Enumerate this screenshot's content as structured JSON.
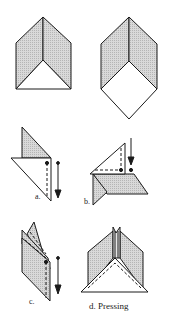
{
  "diagram": {
    "colors": {
      "stroke": "#1a1a1a",
      "shade": "#cfcfcf",
      "paper": "#ffffff"
    },
    "figures": [
      {
        "id": "top-left",
        "label": ""
      },
      {
        "id": "top-right",
        "label": ""
      },
      {
        "id": "a",
        "label": "a."
      },
      {
        "id": "b",
        "label": "b."
      },
      {
        "id": "c",
        "label": "c."
      },
      {
        "id": "d",
        "label": "d.  Pressing"
      }
    ]
  }
}
